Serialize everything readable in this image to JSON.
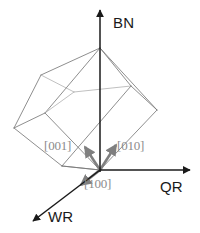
{
  "figure": {
    "type": "3d-orientation-diagram",
    "background_color": "#ffffff"
  },
  "axes": [
    {
      "id": "bn",
      "label": "BN",
      "description": "Normal direction axis pointing up",
      "color": "#1a1a1a",
      "origin": [
        100,
        170
      ],
      "tip": [
        100,
        8
      ]
    },
    {
      "id": "qr",
      "label": "QR",
      "description": "Rolling direction axis pointing right",
      "color": "#1a1a1a",
      "origin": [
        100,
        170
      ],
      "tip": [
        192,
        170
      ]
    },
    {
      "id": "wr",
      "label": "WR",
      "description": "Transverse direction axis pointing down-left",
      "color": "#1a1a1a",
      "origin": [
        100,
        170
      ],
      "tip": [
        30,
        224
      ]
    }
  ],
  "directions": [
    {
      "id": "d001",
      "label": "[001]",
      "color": "#8c8c8c",
      "origin": [
        100,
        170
      ],
      "tip": [
        84,
        146
      ]
    },
    {
      "id": "d010",
      "label": "[010]",
      "color": "#8c8c8c",
      "origin": [
        100,
        170
      ],
      "tip": [
        117,
        144
      ]
    },
    {
      "id": "d100",
      "label": "[100]",
      "color": "#8c8c8c",
      "origin": [
        100,
        170
      ],
      "tip": [
        80,
        186
      ]
    }
  ],
  "cube": {
    "description": "Wireframe cube tilted so one body diagonal is near vertical",
    "edge_color": "#7a7a7a",
    "hidden_edge_color": "#9e9e9e",
    "vertices": {
      "top": [
        100,
        48
      ],
      "left": [
        14,
        128
      ],
      "right": [
        157,
        110
      ],
      "bottom": [
        100,
        170
      ],
      "upper_left": [
        41,
        75
      ],
      "upper_right": [
        131,
        86
      ],
      "mid_left": [
        45,
        113
      ],
      "mid_front": [
        62,
        166
      ]
    }
  },
  "colors": {
    "axis": "#1a1a1a",
    "direction_vector": "#7f7f7f",
    "cube_edge": "#7a7a7a",
    "label_axis": "#1a1a1a",
    "label_direction": "#8c8c8c"
  }
}
